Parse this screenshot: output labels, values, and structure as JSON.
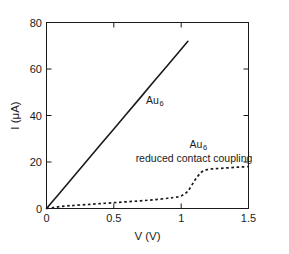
{
  "chart_data": {
    "type": "line",
    "title": "",
    "xlabel": "V (V)",
    "ylabel": "I (μA)",
    "xlim": [
      0,
      1.5
    ],
    "ylim": [
      0,
      80
    ],
    "grid": false,
    "legend_position": "inline-annotations",
    "xticks": [
      "0",
      "0.5",
      "1",
      "1.5"
    ],
    "xtick_values": [
      0,
      0.5,
      1,
      1.5
    ],
    "yticks": [
      "0",
      "20",
      "40",
      "60",
      "80"
    ],
    "ytick_values": [
      0,
      20,
      40,
      60,
      80
    ],
    "series": [
      {
        "name": "Au6",
        "style": "solid",
        "color": "#1a1a1a",
        "x": [
          0,
          0.1,
          0.2,
          0.3,
          0.4,
          0.5,
          0.6,
          0.7,
          0.8,
          0.9,
          1.0,
          1.05
        ],
        "values": [
          0,
          6.8,
          13.7,
          20.5,
          27.4,
          34.2,
          41.1,
          47.9,
          54.8,
          61.6,
          68.5,
          71.9
        ]
      },
      {
        "name": "Au6 reduced contact coupling",
        "style": "dashed",
        "color": "#1a1a1a",
        "x": [
          0,
          0.05,
          0.1,
          0.15,
          0.2,
          0.3,
          0.4,
          0.5,
          0.6,
          0.7,
          0.8,
          0.9,
          0.95,
          1.0,
          1.05,
          1.1,
          1.15,
          1.2,
          1.25,
          1.3,
          1.35,
          1.4,
          1.45,
          1.5
        ],
        "values": [
          0,
          0.4,
          0.8,
          1.1,
          1.3,
          1.7,
          2.1,
          2.5,
          2.9,
          3.3,
          3.8,
          4.4,
          4.8,
          5.4,
          7.5,
          12.0,
          15.6,
          16.8,
          17.1,
          17.3,
          17.5,
          17.7,
          17.9,
          18.0
        ]
      }
    ],
    "annotations": [
      {
        "name": "solid-curve-label",
        "text": "Au",
        "subscript": "6",
        "x": 0.74,
        "y": 46.5
      },
      {
        "name": "dashed-curve-label-line1",
        "text": "Au",
        "subscript": "6",
        "x": 1.15,
        "y": 25.5
      },
      {
        "name": "dashed-curve-label-line2",
        "text": "reduced contact coupling",
        "x": 1.03,
        "y": 21.5
      }
    ]
  }
}
